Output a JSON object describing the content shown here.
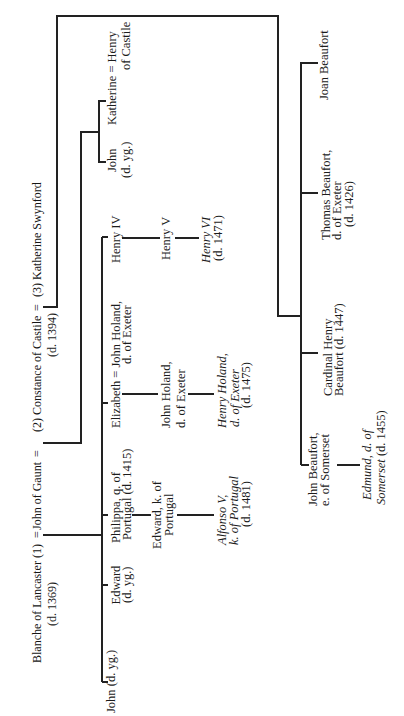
{
  "title": {
    "blanche": "Blanche of Lancaster (1)",
    "eq1": "=",
    "gaunt": "John of Gaunt",
    "eq2": "=",
    "constance": "(2) Constance of Castile",
    "eq3": "=",
    "swynford": "(3) Katherine Swynford"
  },
  "title_notes": {
    "blanche_death": "(d. 1369)",
    "constance_death": "(d. 1394)"
  },
  "people": {
    "john_blanche": {
      "lines": [
        "John (d. yg.)"
      ]
    },
    "edward_blanche": {
      "lines": [
        "Edward",
        "(d. yg.)"
      ]
    },
    "philippa": {
      "lines": [
        "Philippa, q. of",
        "Portugal (d. 1415)"
      ]
    },
    "elizabeth": {
      "lines": [
        "Elizabeth = John Holand,",
        "d. of Exeter"
      ]
    },
    "henry_iv": {
      "lines": [
        "Henry IV"
      ]
    },
    "edward_portugal": {
      "lines": [
        "Edward, k. of",
        "Portugal"
      ]
    },
    "alfonso": {
      "lines": [
        "Alfonso V,",
        "k. of Portugal",
        "(d. 1481)"
      ]
    },
    "john_holand": {
      "lines": [
        "John Holand,",
        "d. of Exeter"
      ]
    },
    "henry_holand": {
      "lines": [
        "Henry Holand,",
        "d. of Exeter",
        "(d. 1475)"
      ]
    },
    "henry_v": {
      "lines": [
        "Henry V"
      ]
    },
    "henry_vi": {
      "lines": [
        "Henry VI",
        "(d. 1471)"
      ]
    },
    "john_constance": {
      "lines": [
        "John",
        "(d. yg.)"
      ]
    },
    "katherine": {
      "lines": [
        "Katherine = Henry",
        "of Castile"
      ]
    },
    "joan_beaufort": {
      "lines": [
        "Joan Beaufort"
      ]
    },
    "thomas_beaufort": {
      "lines": [
        "Thomas Beaufort,",
        "d. of Exeter",
        "(d. 1426)"
      ]
    },
    "henry_beaufort": {
      "lines": [
        "Cardinal Henry",
        "Beaufort (d. 1447)"
      ]
    },
    "john_beaufort": {
      "lines": [
        "John Beaufort,",
        "e. of Somerset"
      ]
    },
    "edmund": {
      "lines": [
        "Edmund, d. of",
        "Somerset",
        "(d. 1455)"
      ]
    }
  },
  "colors": {
    "ink": "#1c1c1c",
    "lines": "#222222",
    "paper": "#ffffff"
  }
}
